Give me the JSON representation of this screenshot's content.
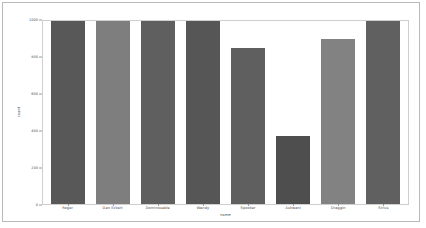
{
  "chart_data": {
    "type": "bar",
    "title": "",
    "xlabel": "name",
    "ylabel": "count",
    "categories": [
      "Roger",
      "Dan Eckert",
      "Dominoseble",
      "Wendy",
      "Spooker",
      "Ashwani",
      "Draggin",
      "Sirius"
    ],
    "values": [
      1000,
      1000,
      1000,
      1000,
      850,
      370,
      900,
      1000
    ],
    "ylim": [
      0,
      1000
    ],
    "yticks": [
      0,
      200,
      400,
      600,
      800,
      1000
    ],
    "ytick_labels": [
      "0",
      "200",
      "400",
      "600",
      "800",
      "1000"
    ],
    "grid": false,
    "legend": null,
    "bar_colors": [
      "#585858",
      "#7e7e7e",
      "#5f5f5f",
      "#565656",
      "#5f5f5f",
      "#4e4e4e",
      "#828282",
      "#606060"
    ]
  },
  "figure": {
    "frame_color": "#b9b9b9",
    "axes_border_color": "#cfcfcf",
    "background": "#ffffff"
  }
}
